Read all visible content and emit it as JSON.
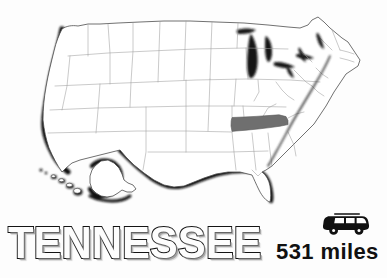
{
  "graphic": {
    "kind": "us-state-locator-map",
    "background_color": "#fdfdfd"
  },
  "title": {
    "text": "TENNESSEE",
    "style": "outlined-drop-shadow",
    "outline_color": "#141414",
    "fill_color": "#fdfdfd",
    "shadow_color": "#9a9a9a"
  },
  "distance": {
    "value": "531",
    "unit": "miles",
    "label": "531 miles",
    "icon": "car-icon",
    "icon_color": "#111111",
    "text_color": "#111111"
  },
  "map": {
    "region": "United States",
    "highlighted_state": "Tennessee",
    "highlight_fill": "#6f6f6f",
    "state_border_color": "#9d9d9d",
    "outline_color": "#4a4a4a",
    "coast_shadow_color": "#111111",
    "water_fill": "#151515",
    "land_fill": "#ffffff",
    "insets": [
      {
        "name": "Alaska"
      },
      {
        "name": "Hawaii"
      }
    ],
    "water_bodies": [
      {
        "name": "Lake Michigan"
      },
      {
        "name": "Lake Superior"
      },
      {
        "name": "Lake Huron"
      },
      {
        "name": "Lake Erie"
      },
      {
        "name": "Lake Ontario"
      }
    ]
  }
}
